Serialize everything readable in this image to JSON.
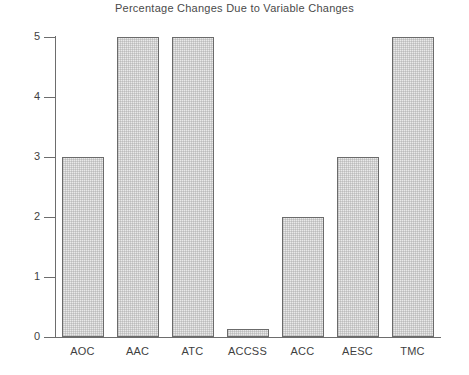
{
  "chart_data": {
    "type": "bar",
    "title": "Percentage Changes Due to Variable Changes",
    "xlabel": "",
    "ylabel": "",
    "categories": [
      "AOC",
      "AAC",
      "ATC",
      "ACCSS",
      "ACC",
      "AESC",
      "TMC"
    ],
    "values": [
      3,
      5,
      5,
      0.13,
      2,
      3,
      5
    ],
    "ylim": [
      0,
      5
    ],
    "yticks": [
      0,
      1,
      2,
      3,
      4,
      5
    ],
    "ytick_labels": [
      "0",
      "1",
      "2",
      "3",
      "4",
      "5"
    ],
    "grid": false,
    "legend": null,
    "colors": {
      "bar_fill": "#e9e9e9",
      "bar_edge": "#6b6b6b",
      "axis": "#6d6d6d",
      "text": "#3f3f3f",
      "background": "#ffffff"
    }
  }
}
